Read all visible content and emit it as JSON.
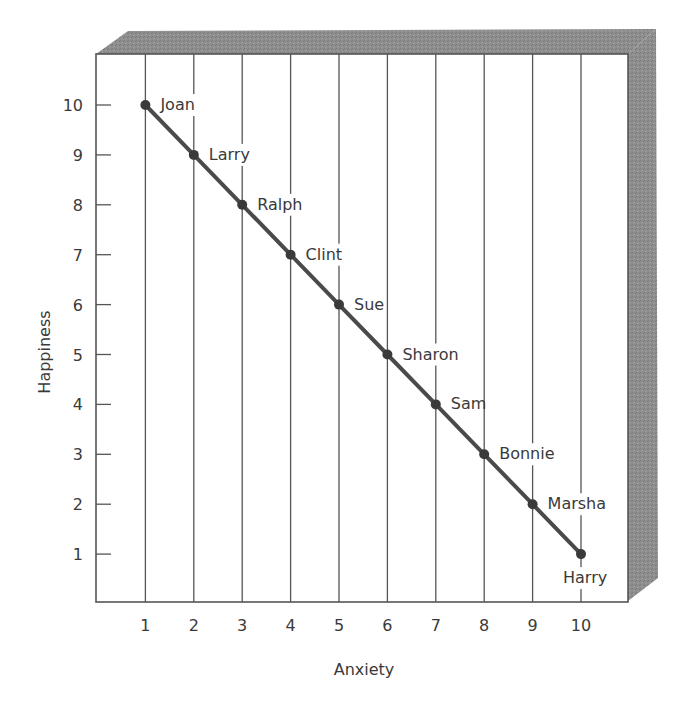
{
  "chart_data": {
    "type": "line",
    "title": "",
    "xlabel": "Anxiety",
    "ylabel": "Happiness",
    "x": [
      1,
      2,
      3,
      4,
      5,
      6,
      7,
      8,
      9,
      10
    ],
    "xticks": [
      "1",
      "2",
      "3",
      "4",
      "5",
      "6",
      "7",
      "8",
      "9",
      "10"
    ],
    "yticks": [
      "1",
      "2",
      "3",
      "4",
      "5",
      "6",
      "7",
      "8",
      "9",
      "10"
    ],
    "xlim": [
      0,
      11
    ],
    "ylim": [
      0,
      11
    ],
    "grid": "vertical lines at each x tick",
    "legend": "none",
    "series": [
      {
        "name": "Happiness vs Anxiety",
        "points": [
          {
            "label": "Joan",
            "x": 1,
            "y": 10
          },
          {
            "label": "Larry",
            "x": 2,
            "y": 9
          },
          {
            "label": "Ralph",
            "x": 3,
            "y": 8
          },
          {
            "label": "Clint",
            "x": 4,
            "y": 7
          },
          {
            "label": "Sue",
            "x": 5,
            "y": 6
          },
          {
            "label": "Sharon",
            "x": 6,
            "y": 5
          },
          {
            "label": "Sam",
            "x": 7,
            "y": 4
          },
          {
            "label": "Bonnie",
            "x": 8,
            "y": 3
          },
          {
            "label": "Marsha",
            "x": 9,
            "y": 2
          },
          {
            "label": "Harry",
            "x": 10,
            "y": 1
          }
        ]
      }
    ]
  },
  "colors": {
    "line": "#4a4a4a",
    "frame_shade": "#8c8c8c",
    "axis": "#555555",
    "gridline": "#555555"
  }
}
